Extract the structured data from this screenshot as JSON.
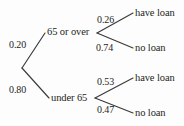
{
  "diagram": {
    "kind": "probability-tree",
    "line_color": "#3a3a3c",
    "text_color": "#231f20",
    "background": "#fdfdfd",
    "root": {
      "label": ""
    },
    "level1": [
      {
        "id": "age-old",
        "label": "65 or over",
        "probability": "0.20"
      },
      {
        "id": "age-young",
        "label": "under 65",
        "probability": "0.80"
      }
    ],
    "level2": [
      {
        "id": "old-have",
        "parent": "age-old",
        "label": "have loan",
        "probability": "0.26"
      },
      {
        "id": "old-no",
        "parent": "age-old",
        "label": "no loan",
        "probability": "0.74"
      },
      {
        "id": "young-have",
        "parent": "age-young",
        "label": "have loan",
        "probability": "0.53"
      },
      {
        "id": "young-no",
        "parent": "age-young",
        "label": "no loan",
        "probability": "0.47"
      }
    ]
  }
}
